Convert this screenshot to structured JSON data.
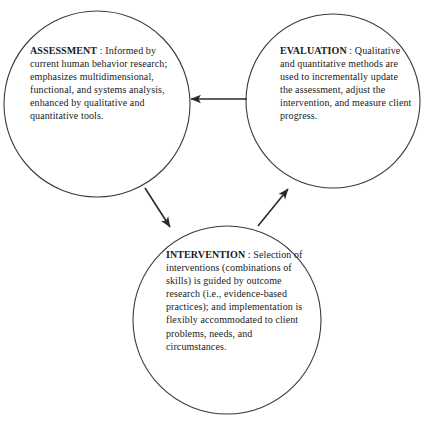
{
  "diagram": {
    "type": "cycle-venn",
    "background_color": "#ffffff",
    "stroke_color": "#3a3a3a",
    "text_color": "#1a1a1a",
    "nodes": [
      {
        "id": "assessment",
        "title": "ASSESSMENT",
        "separator": " : ",
        "body": "Informed by current human behavior research; emphasizes multidimensional, functional, and systems analysis, enhanced by qualitative and quantitative tools.",
        "full_text": "ASSESSMENT : Informed by current human behavior research; emphasizes multidimensional, functional, and systems analysis, enhanced by qualitative and quantitative tools.",
        "center_x": 97,
        "center_y": 104,
        "radius": 93
      },
      {
        "id": "evaluation",
        "title": "EVALUATION",
        "separator": " : ",
        "body": "Qualitative and quantitative methods are used to incrementally update the assessment, adjust the intervention, and measure client progress.",
        "full_text": "EVALUATION : Qualitative and quantitative methods are used to incrementally update the assessment, adjust the intervention, and measure client progress.",
        "center_x": 333,
        "center_y": 101,
        "radius": 87
      },
      {
        "id": "intervention",
        "title": "INTERVENTION",
        "separator": " : ",
        "body": "Selection of interventions (combinations of skills) is guided by outcome research (i.e., evidence-based practices); and implementation is flexibly accommodated to client problems, needs, and circumstances.",
        "full_text": "INTERVENTION : Selection of interventions (combinations of skills) is guided by outcome research (i.e., evidence-based practices); and implementation is flexibly accommodated to client problems, needs, and circumstances.",
        "center_x": 227,
        "center_y": 320,
        "radius": 94
      }
    ],
    "arrows": [
      {
        "id": "evaluation-to-assessment",
        "from": "evaluation",
        "to": "assessment",
        "direction": "left",
        "x1": 247,
        "y1": 99,
        "x2": 189,
        "y2": 99
      },
      {
        "id": "assessment-to-intervention",
        "from": "assessment",
        "to": "intervention",
        "direction": "down-right",
        "x1": 145,
        "y1": 188,
        "x2": 172,
        "y2": 229
      },
      {
        "id": "intervention-to-evaluation",
        "from": "intervention",
        "to": "evaluation",
        "direction": "up-right",
        "x1": 258,
        "y1": 226,
        "x2": 290,
        "y2": 186
      }
    ]
  }
}
